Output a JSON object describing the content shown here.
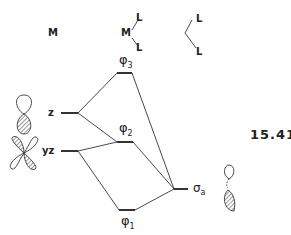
{
  "figure_number": "15.41",
  "headers": {
    "metal": "M",
    "complex_metal": "M",
    "complex_ligand_top": "L",
    "complex_ligand_bottom": "L",
    "ligand_top": "L",
    "ligand_bottom": "L"
  },
  "left_orbitals": [
    {
      "label": "z",
      "y": 113
    },
    {
      "label": "yz",
      "y": 151
    }
  ],
  "mo_levels": [
    {
      "symbol": "φ",
      "subscript": "3",
      "y": 73
    },
    {
      "symbol": "φ",
      "subscript": "2",
      "y": 142
    },
    {
      "symbol": "φ",
      "subscript": "1",
      "y": 210
    }
  ],
  "right_orbital": {
    "symbol": "σ",
    "subscript": "a",
    "y": 189
  },
  "colors": {
    "line": "#333333",
    "background": "#ffffff"
  }
}
